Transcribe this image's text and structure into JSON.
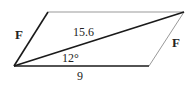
{
  "diagram": {
    "type": "parallelogram-vector-addition",
    "labels": {
      "left_side": "F",
      "right_side": "F",
      "diagonal": "15.6",
      "angle": "12°",
      "base": "9"
    },
    "colors": {
      "edge": "#1a1a1a",
      "side_faint": "#888888"
    }
  }
}
